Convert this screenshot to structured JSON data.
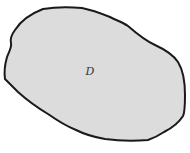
{
  "diagram": {
    "type": "region",
    "region": {
      "label": "D",
      "fill_color": "#dcdcdc",
      "stroke_color": "#1a1a1a"
    }
  }
}
